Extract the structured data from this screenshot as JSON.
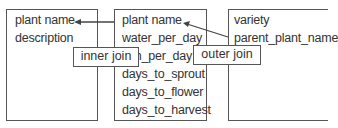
{
  "tables": [
    {
      "name": "left-table",
      "fields": [
        "plant name",
        "description"
      ]
    },
    {
      "name": "middle-table",
      "fields": [
        "plant name",
        "water_per_day",
        "sun_per_day",
        "days_to_sprout",
        "days_to_flower",
        "days_to_harvest"
      ]
    },
    {
      "name": "right-table",
      "fields": [
        "variety",
        "parent_plant_name"
      ]
    }
  ],
  "joins": [
    {
      "label": "inner join"
    },
    {
      "label": "outer join"
    }
  ]
}
